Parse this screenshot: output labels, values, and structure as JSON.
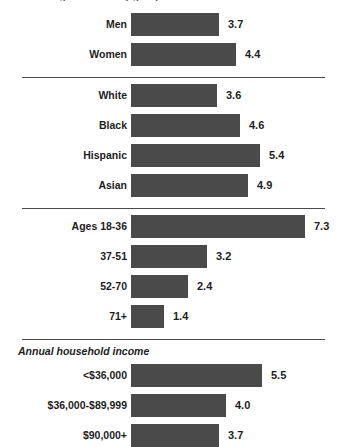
{
  "clipped_header": "Percentage of adults by group",
  "chart_data": {
    "type": "bar",
    "orientation": "horizontal",
    "title": "",
    "xlabel": "",
    "ylabel": "",
    "xlim": [
      0,
      7.3
    ],
    "grid": false,
    "legend": "none",
    "value_format": "one-decimal",
    "bar_color": "#4a4a4a",
    "categories": [
      "Men",
      "Women",
      "White",
      "Black",
      "Hispanic",
      "Asian",
      "Ages 18-36",
      "37-51",
      "52-70",
      "71+",
      "<$36,000",
      "$36,000-$89,999",
      "$90,000+"
    ],
    "values": [
      3.7,
      4.4,
      3.6,
      4.6,
      5.4,
      4.9,
      7.3,
      3.2,
      2.4,
      1.4,
      5.5,
      4.0,
      3.7
    ],
    "groups": [
      {
        "caption": "",
        "rows": [
          {
            "label": "Men",
            "value": 3.7,
            "value_text": "3.7"
          },
          {
            "label": "Women",
            "value": 4.4,
            "value_text": "4.4"
          }
        ]
      },
      {
        "caption": "",
        "rows": [
          {
            "label": "White",
            "value": 3.6,
            "value_text": "3.6"
          },
          {
            "label": "Black",
            "value": 4.6,
            "value_text": "4.6"
          },
          {
            "label": "Hispanic",
            "value": 5.4,
            "value_text": "5.4"
          },
          {
            "label": "Asian",
            "value": 4.9,
            "value_text": "4.9"
          }
        ]
      },
      {
        "caption": "",
        "rows": [
          {
            "label": "Ages 18-36",
            "value": 7.3,
            "value_text": "7.3"
          },
          {
            "label": "37-51",
            "value": 3.2,
            "value_text": "3.2"
          },
          {
            "label": "52-70",
            "value": 2.4,
            "value_text": "2.4"
          },
          {
            "label": "71+",
            "value": 1.4,
            "value_text": "1.4"
          }
        ]
      },
      {
        "caption": "Annual household income",
        "rows": [
          {
            "label": "<$36,000",
            "value": 5.5,
            "value_text": "5.5"
          },
          {
            "label": "$36,000-$89,999",
            "value": 4.0,
            "value_text": "4.0"
          },
          {
            "label": "$90,000+",
            "value": 3.7,
            "value_text": "3.7"
          }
        ]
      }
    ]
  },
  "layout": {
    "bar_origin_x": 131,
    "px_per_unit": 23.8,
    "row_pitch": 30,
    "first_row_top": 12,
    "separator_left": 22,
    "separator_width": 303
  }
}
